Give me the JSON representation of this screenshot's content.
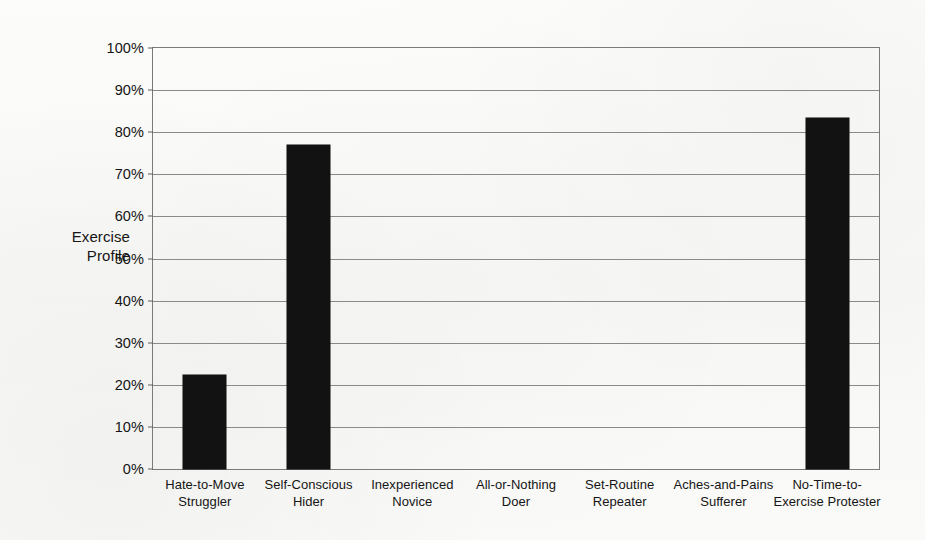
{
  "chart_data": {
    "type": "bar",
    "title": "",
    "subtitle": "",
    "xlabel": "",
    "ylabel": "Exercise\nProfile",
    "ylabel_lines": [
      "Exercise",
      "Profile"
    ],
    "categories": [
      "Hate-to-Move\nStruggler",
      "Self-Conscious\nHider",
      "Inexperienced\nNovice",
      "All-or-Nothing\nDoer",
      "Set-Routine\nRepeater",
      "Aches-and-Pains\nSufferer",
      "No-Time-to-\nExercise Protester"
    ],
    "values": [
      22.3,
      77.0,
      0,
      0,
      0,
      0,
      83.5
    ],
    "ylim": [
      0,
      100
    ],
    "ytick_values": [
      0,
      10,
      20,
      30,
      40,
      50,
      60,
      70,
      80,
      90,
      100
    ],
    "ytick_labels": [
      "0%",
      "10%",
      "20%",
      "30%",
      "40%",
      "50%",
      "60%",
      "70%",
      "80%",
      "90%",
      "100%"
    ],
    "grid": true,
    "legend": "none",
    "legend_position": "none",
    "bar_color": "#121212",
    "grid_color": "#8a8a8a",
    "axis_color": "#7a7a7a",
    "background_color": "#fbfbf9",
    "annotations": []
  }
}
